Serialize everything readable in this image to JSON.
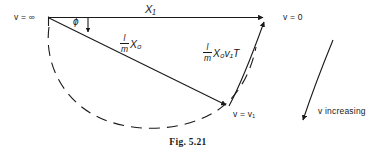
{
  "figure": {
    "caption": "Fig. 5.21",
    "type": "vector-diagram"
  },
  "labels": {
    "v_infinity": "v = ∞",
    "v_zero": "v = 0",
    "v_one": "v = v₁",
    "v_increasing": "v increasing",
    "x1": "X₁",
    "phi": "ϕ"
  },
  "vectors": [
    {
      "name": "x1-vector",
      "label": "X₁",
      "from": "v = ∞",
      "to": "v = 0",
      "style": "solid-arrow"
    },
    {
      "name": "x0-vector",
      "label_numerator": "l",
      "label_denominator": "m",
      "label_rest": "X₀",
      "from": "v = ∞",
      "to": "v = v₁",
      "style": "solid-arrow"
    },
    {
      "name": "x0v1t-vector",
      "label_numerator": "l",
      "label_denominator": "m",
      "label_rest": "X₀v₁T",
      "from": "v = v₁",
      "to": "v = 0",
      "style": "solid-arrow"
    }
  ],
  "annotations": {
    "angle_marker": "ϕ",
    "arc_style": "dashed",
    "direction_arrow": "v increasing"
  },
  "colors": {
    "ink": "#1a1a1a",
    "background": "#ffffff"
  }
}
